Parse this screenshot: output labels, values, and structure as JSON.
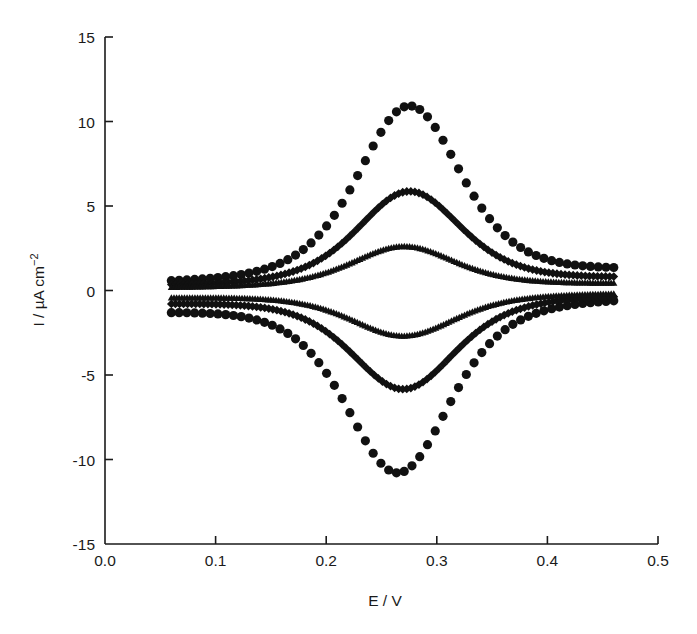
{
  "chart_data": {
    "type": "scatter",
    "title": "",
    "xlabel": "E / V",
    "ylabel": "I / µA cm⁻²",
    "ylabel_parts": {
      "main": "I / µA cm",
      "superscript": "−2"
    },
    "xlim": [
      0.0,
      0.5
    ],
    "ylim": [
      -15,
      15
    ],
    "x_ticks": [
      0.0,
      0.1,
      0.2,
      0.3,
      0.4,
      0.5
    ],
    "x_tick_labels": [
      "0.0",
      "0.1",
      "0.2",
      "0.3",
      "0.4",
      "0.5"
    ],
    "y_ticks": [
      -15,
      -10,
      -5,
      0,
      5,
      10,
      15
    ],
    "y_tick_labels": [
      "-15",
      "-10",
      "-5",
      "0",
      "5",
      "10",
      "15"
    ],
    "grid": false,
    "legend": null,
    "potential_range": [
      0.06,
      0.46
    ],
    "series": [
      {
        "name": "circles (highest scan rate)",
        "marker": "circle",
        "anodic_peak": {
          "E": 0.275,
          "I": 10.0
        },
        "cathodic_peak": {
          "E": 0.265,
          "I": -9.9
        },
        "baseline_anodic": 0.9,
        "baseline_cathodic": -0.9,
        "n_points": 58
      },
      {
        "name": "diamonds (intermediate scan rate)",
        "marker": "diamond",
        "anodic_peak": {
          "E": 0.275,
          "I": 5.3
        },
        "cathodic_peak": {
          "E": 0.27,
          "I": -5.3
        },
        "baseline_anodic": 0.55,
        "baseline_cathodic": -0.55,
        "n_points": 110
      },
      {
        "name": "triangles (lowest scan rate)",
        "marker": "triangle",
        "anodic_peak": {
          "E": 0.27,
          "I": 2.3
        },
        "cathodic_peak": {
          "E": 0.27,
          "I": -2.4
        },
        "baseline_anodic": 0.3,
        "baseline_cathodic": -0.3,
        "n_points": 170
      }
    ]
  }
}
